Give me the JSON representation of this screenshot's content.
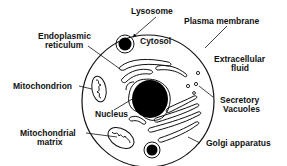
{
  "diagram": {
    "labels": {
      "lysosome": "Lysosome",
      "plasma_membrane": "Plasma membrane",
      "endoplasmic_reticulum_1": "Endoplasmic",
      "endoplasmic_reticulum_2": "reticulum",
      "cytosol": "Cytosol",
      "extracellular_fluid_1": "Extracellular",
      "extracellular_fluid_2": "fluid",
      "mitochondrion": "Mitochondrion",
      "nucleus": "Nucleus",
      "secretory_vacuoles_1": "Secretory",
      "secretory_vacuoles_2": "Vacuoles",
      "mitochondrial_matrix_1": "Mitochondrial",
      "mitochondrial_matrix_2": "matrix",
      "golgi_apparatus": "Golgi apparatus"
    },
    "colors": {
      "line": "#111111",
      "fill": "#000000",
      "background": "#ffffff"
    }
  }
}
